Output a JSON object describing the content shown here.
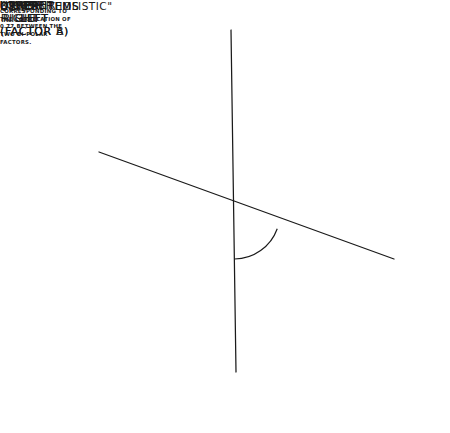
{
  "figure": {
    "type": "scatter",
    "background": "#ffffff",
    "ink_color": "#1a1a1a",
    "width": 450,
    "height": 433
  },
  "axes": {
    "vertical": {
      "name": "bipolar-axis-vertical",
      "top_label": "UPPER\nRIGHT",
      "bottom_label": "LOWER\nLEFT\n(FACTOR A)",
      "x1": 231,
      "y1": 30,
      "x2": 236,
      "y2": 372
    },
    "oblique": {
      "name": "bipolar-axis-oblique",
      "top_label": "UPPER\nLEFT\n(FACTOR B)",
      "bottom_label": "LOWER\nRIGHT",
      "x1": 99,
      "y1": 152,
      "x2": 394,
      "y2": 259
    }
  },
  "labels": {
    "upper_right": "UPPER\nRIGHT",
    "lower_left": "LOWER\nLEFT\n(FACTOR A)",
    "upper_left": "UPPER\nLEFT\n(FACTOR B)",
    "lower_right": "LOWER\nRIGHT",
    "other_items_right": "OTHER ITEMS",
    "other_items_left": "OTHER ITEMS",
    "item_callout": "ITEM 38 \"HOLISTIC\""
  },
  "angle": {
    "value": "68.3°",
    "note": "is the angle corresponding to the correlation of 0.77 between the two bi-polar factors.",
    "degrees": 68.3,
    "correlation": 0.77,
    "vertex_x": 234,
    "vertex_y": 213,
    "arc_radius": 46
  },
  "callout_arrow": {
    "name": "item-38-arrow",
    "from_x": 234,
    "from_y": 213,
    "to_x": 253,
    "to_y": 147
  },
  "chart_data": {
    "type": "scatter",
    "title": "",
    "xlabel": "",
    "ylabel": "",
    "xlim": [
      0,
      450
    ],
    "ylim": [
      0,
      433
    ],
    "grid": false,
    "legend": null,
    "point_radius": 3.4,
    "series": [
      {
        "name": "upper-right-cluster",
        "points": [
          [
            216,
            73
          ],
          [
            231,
            64
          ],
          [
            240,
            72
          ],
          [
            251,
            78
          ],
          [
            222,
            88
          ],
          [
            234,
            84
          ],
          [
            247,
            94
          ],
          [
            211,
            95
          ],
          [
            237,
            102
          ],
          [
            251,
            105
          ],
          [
            205,
            108
          ],
          [
            227,
            110
          ]
        ]
      },
      {
        "name": "upper-left-cluster",
        "points": [
          [
            95,
            133
          ],
          [
            121,
            135
          ],
          [
            111,
            145
          ],
          [
            123,
            146
          ],
          [
            91,
            152
          ],
          [
            99,
            158
          ],
          [
            107,
            160
          ],
          [
            119,
            158
          ],
          [
            104,
            172
          ],
          [
            117,
            174
          ],
          [
            131,
            165
          ],
          [
            142,
            147
          ],
          [
            95,
            166
          ]
        ]
      },
      {
        "name": "lower-right-cluster",
        "points": [
          [
            334,
            241
          ],
          [
            346,
            235
          ],
          [
            357,
            230
          ],
          [
            368,
            236
          ],
          [
            379,
            229
          ],
          [
            390,
            237
          ],
          [
            340,
            252
          ],
          [
            352,
            248
          ],
          [
            364,
            245
          ],
          [
            375,
            252
          ],
          [
            328,
            262
          ],
          [
            343,
            266
          ],
          [
            357,
            264
          ],
          [
            370,
            259
          ],
          [
            393,
            246
          ],
          [
            330,
            276
          ],
          [
            352,
            279
          ],
          [
            385,
            256
          ]
        ]
      },
      {
        "name": "lower-left-cluster",
        "points": [
          [
            212,
            318
          ],
          [
            238,
            305
          ],
          [
            203,
            330
          ],
          [
            227,
            322
          ],
          [
            248,
            324
          ],
          [
            216,
            336
          ],
          [
            241,
            339
          ],
          [
            260,
            331
          ],
          [
            198,
            347
          ],
          [
            231,
            351
          ],
          [
            252,
            352
          ],
          [
            211,
            359
          ],
          [
            240,
            363
          ],
          [
            266,
            357
          ],
          [
            185,
            360
          ]
        ]
      },
      {
        "name": "other-items-scatter",
        "points": [
          [
            149,
            76
          ],
          [
            289,
            46
          ],
          [
            337,
            55
          ],
          [
            321,
            96
          ],
          [
            93,
            224
          ],
          [
            178,
            272
          ],
          [
            211,
            241
          ],
          [
            252,
            136
          ],
          [
            276,
            228
          ],
          [
            310,
            146
          ],
          [
            380,
            222
          ],
          [
            134,
            304
          ],
          [
            297,
            338
          ],
          [
            293,
            367
          ],
          [
            155,
            348
          ]
        ]
      }
    ]
  }
}
